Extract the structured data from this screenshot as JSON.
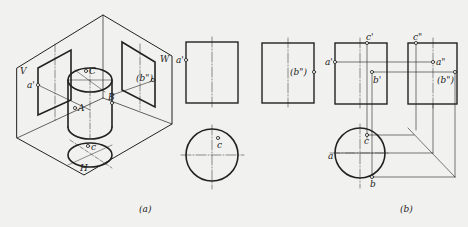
{
  "figure": {
    "panel_a": {
      "caption": "(a)",
      "planes": {
        "v": "V",
        "w": "W",
        "h": "H"
      },
      "points": {
        "a_prime": "a'",
        "c_upper": "C",
        "a_upper": "A",
        "b_upper": "B",
        "b_dprime_paren": "(b\")",
        "c_lower": "c"
      }
    },
    "panel_mid": {
      "points": {
        "a_prime": "a'",
        "b_dprime_paren": "(b\")",
        "c": "c"
      }
    },
    "panel_b": {
      "caption": "(b)",
      "points": {
        "c_prime": "c'",
        "c_dprime": "c\"",
        "a_prime": "a'",
        "a_dprime": "a\"",
        "b_prime": "b'",
        "b_dprime_paren": "(b\")",
        "a": "a",
        "c": "c",
        "b": "b"
      }
    }
  }
}
